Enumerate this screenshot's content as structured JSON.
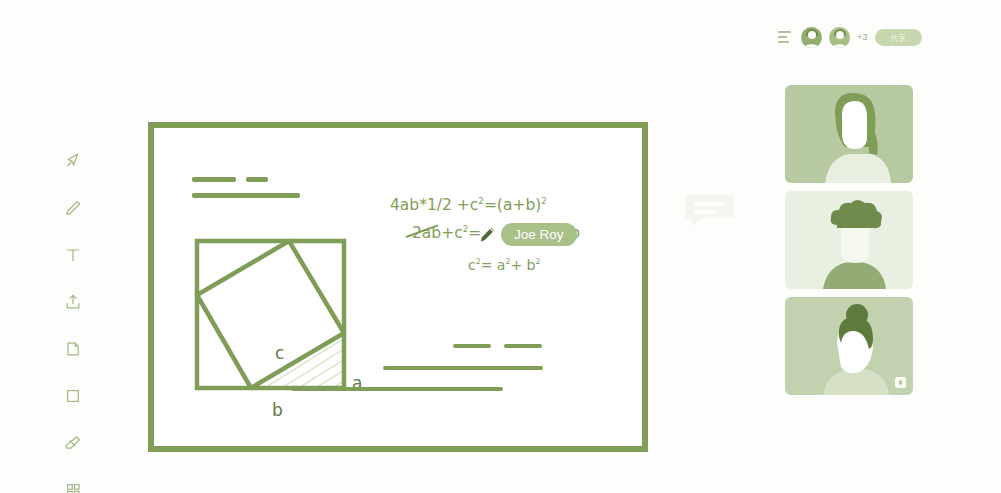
{
  "header": {
    "menu_icon": "menu-icon",
    "avatars": [
      {
        "name": "participant-avatar-1"
      },
      {
        "name": "participant-avatar-2"
      }
    ],
    "overflow_count": "+3",
    "action_pill_label": "共享"
  },
  "toolbar": {
    "items": [
      {
        "icon": "cursor-select-icon",
        "label": "Select"
      },
      {
        "icon": "pencil-icon",
        "label": "Pen"
      },
      {
        "icon": "text-icon",
        "label": "Text"
      },
      {
        "icon": "upload-icon",
        "label": "Upload"
      },
      {
        "icon": "sticky-note-icon",
        "label": "Note"
      },
      {
        "icon": "square-shape-icon",
        "label": "Shape"
      },
      {
        "icon": "eraser-icon",
        "label": "Eraser"
      },
      {
        "icon": "grid-apps-icon",
        "label": "Apps"
      }
    ]
  },
  "board": {
    "heading_placeholders": [
      {
        "width": 44,
        "height": 5,
        "x": 38,
        "y": 49
      },
      {
        "width": 22,
        "height": 5,
        "x": 92,
        "y": 49
      },
      {
        "width": 108,
        "height": 5,
        "x": 38,
        "y": 65
      }
    ],
    "footer_placeholders": [
      {
        "width": 38,
        "height": 4,
        "x": 299,
        "y": 216
      },
      {
        "width": 38,
        "height": 4,
        "x": 350,
        "y": 216
      },
      {
        "width": 160,
        "height": 4,
        "x": 229,
        "y": 238
      },
      {
        "width": 212,
        "height": 4,
        "x": 137,
        "y": 259
      }
    ],
    "equations": {
      "line1_pre": "4ab*1/2 +c",
      "line1_exp1": "2",
      "line1_mid": "=(a+b)",
      "line1_exp2": "2",
      "line2_pre": "2ab+c",
      "line2_exp": "2",
      "line2_post": "=",
      "line2_tail": "b",
      "line3_pre": "c",
      "line3_exp1": "2",
      "line3_mid": "= a",
      "line3_exp2": "2",
      "line3_mid2": "+ b",
      "line3_exp3": "2"
    },
    "geometry": {
      "label_a": "a",
      "label_b": "b",
      "label_c": "c"
    },
    "remote_cursor": {
      "name": "Joe Roy",
      "icon": "pencil-cursor-icon"
    }
  },
  "chat": {
    "icon": "chat-bubble-icon"
  },
  "tiles": [
    {
      "name": "video-tile-1",
      "bg": "#b7c9a0",
      "muted": false
    },
    {
      "name": "video-tile-2",
      "bg": "#eaf0e1",
      "muted": false
    },
    {
      "name": "video-tile-3",
      "bg": "#c2d2ae",
      "muted": true
    }
  ],
  "colors": {
    "accent": "#7f9d57",
    "accent_light": "#a9c089",
    "page_bg": "#fdfdfb"
  }
}
